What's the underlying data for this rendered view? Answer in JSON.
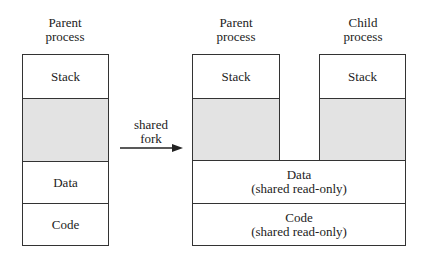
{
  "left": {
    "heading_line1": "Parent",
    "heading_line2": "process",
    "segments": {
      "stack": "Stack",
      "free": "",
      "data": "Data",
      "code": "Code"
    }
  },
  "arrow": {
    "label_line1": "shared",
    "label_line2": "fork"
  },
  "right": {
    "parent": {
      "heading_line1": "Parent",
      "heading_line2": "process",
      "stack": "Stack"
    },
    "child": {
      "heading_line1": "Child",
      "heading_line2": "process",
      "stack": "Stack"
    },
    "shared": {
      "data_line1": "Data",
      "data_line2": "(shared read-only)",
      "code_line1": "Code",
      "code_line2": "(shared read-only)"
    }
  },
  "colors": {
    "free_region": "#e3e3e3",
    "border": "#333333"
  }
}
